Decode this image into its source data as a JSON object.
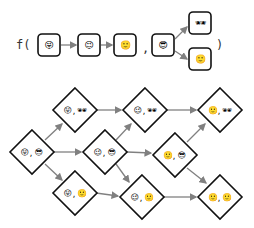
{
  "function_row": {
    "prefix": "f(",
    "separator": ",",
    "suffix": ")",
    "sequence": [
      "😜",
      "😉",
      "🙂"
    ],
    "branch_root": "😎",
    "branch_outputs": [
      "🕶",
      "🙂"
    ]
  },
  "graph": {
    "nodes": [
      {
        "id": "n0",
        "left": "😜",
        "right": "😎"
      },
      {
        "id": "n1",
        "left": "😜",
        "right": "🕶"
      },
      {
        "id": "n2",
        "left": "😉",
        "right": "😎"
      },
      {
        "id": "n3",
        "left": "😉",
        "right": "🕶"
      },
      {
        "id": "n4",
        "left": "😜",
        "right": "🙂"
      },
      {
        "id": "n5",
        "left": "😉",
        "right": "🙂"
      },
      {
        "id": "n6",
        "left": "🙂",
        "right": "😎"
      },
      {
        "id": "n7",
        "left": "🙂",
        "right": "🕶"
      },
      {
        "id": "n8",
        "left": "🙂",
        "right": "🙂"
      }
    ],
    "separator": ","
  },
  "colors": {
    "stroke": "#111111",
    "arrow": "#808080"
  }
}
